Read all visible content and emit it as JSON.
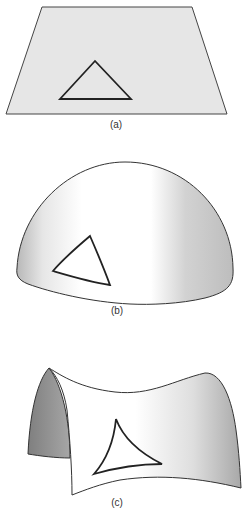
{
  "figure": {
    "panels": [
      {
        "id": "a",
        "label": "(a)",
        "surface": "flat plane",
        "triangle": "straight-sided (angle sum = 180°)"
      },
      {
        "id": "b",
        "label": "(b)",
        "surface": "sphere (positive curvature)",
        "triangle": "bulging sides (angle sum > 180°)"
      },
      {
        "id": "c",
        "label": "(c)",
        "surface": "saddle (negative curvature)",
        "triangle": "concave sides (angle sum < 180°)"
      }
    ]
  },
  "colors": {
    "outline": "#333333",
    "plane_fill": "#e6e6e6",
    "surface_light": "#ffffff",
    "surface_shade": "#b5b5b5",
    "saddle_back": "#8e8e8e"
  }
}
